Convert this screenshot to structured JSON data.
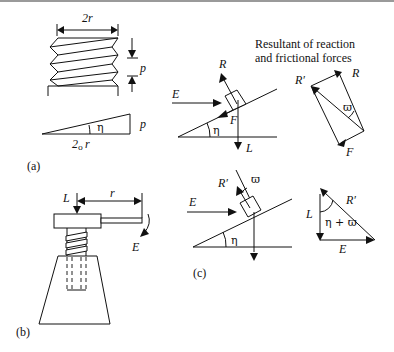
{
  "figure": {
    "panels": [
      {
        "id": "a",
        "caption": "(a)",
        "description": "Screw thread of diameter 2r and pitch p unrolled into an inclined plane"
      },
      {
        "id": "b",
        "caption": "(b)",
        "description": "Screw jack with load L and effort E at lever radius r"
      },
      {
        "id": "c",
        "caption": "(c)",
        "description": "Force diagrams for block on incline with reaction, friction, effort and load"
      }
    ],
    "labels": {
      "two_r": "2r",
      "p_top": "p",
      "p_wedge": "p",
      "circumference": "2πr",
      "circ_base": "2",
      "circ_sub": "o",
      "circ_r": "r",
      "eta": "η",
      "R": "R",
      "R_prime": "R′",
      "E": "E",
      "F": "F",
      "L": "L",
      "r": "r",
      "phi": "ϖ",
      "eta_plus_phi": "η + ϖ"
    },
    "note_line1": "Resultant of reaction",
    "note_line2": "and frictional forces",
    "colors": {
      "ink": "#111111",
      "background": "#ffffff",
      "top_rule": "#9a9a9a"
    }
  }
}
